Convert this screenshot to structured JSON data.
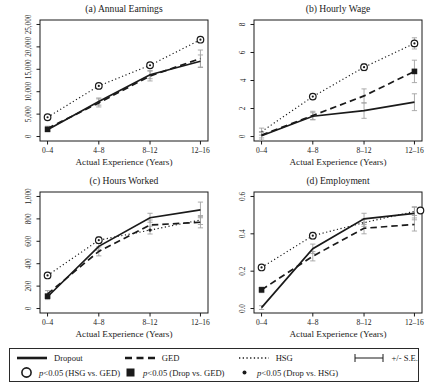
{
  "figure": {
    "xlabel": "Actual Experience (Years)",
    "categories": [
      "0–4",
      "4–8",
      "8–12",
      "12–16"
    ]
  },
  "chart_data": [
    {
      "type": "line",
      "title": "(a) Annual Earnings",
      "xlabel": "Actual Experience (Years)",
      "categories": [
        "0–4",
        "4–8",
        "8–12",
        "12–16"
      ],
      "ylim": [
        0,
        25000
      ],
      "yticks": [
        0,
        5000,
        10000,
        15000,
        20000,
        25000
      ],
      "ytick_labels": [
        "0",
        "5,000",
        "10,000",
        "15,000",
        "20,000",
        "25,000"
      ],
      "series": [
        {
          "name": "Dropout",
          "style": "solid",
          "values": [
            1500,
            7800,
            13800,
            16800
          ],
          "se": [
            400,
            800,
            900,
            1400
          ]
        },
        {
          "name": "GED",
          "style": "dashed",
          "values": [
            1800,
            7500,
            13500,
            17400
          ],
          "se": [
            500,
            900,
            1100,
            1900
          ]
        },
        {
          "name": "HSG",
          "style": "dotted",
          "values": [
            4300,
            11300,
            15900,
            21600
          ],
          "se": [
            300,
            400,
            500,
            600
          ]
        }
      ],
      "sig_markers": [
        {
          "type": "circle-dot",
          "x": 0,
          "y": 4300
        },
        {
          "type": "circle-dot",
          "x": 1,
          "y": 11300
        },
        {
          "type": "circle-dot",
          "x": 2,
          "y": 15900
        },
        {
          "type": "circle-dot",
          "x": 3,
          "y": 21600
        },
        {
          "type": "filled-square",
          "x": 0,
          "y": 1600
        }
      ]
    },
    {
      "type": "line",
      "title": "(b) Hourly Wage",
      "xlabel": "Actual Experience (Years)",
      "categories": [
        "0–4",
        "4–8",
        "8–12",
        "12–16"
      ],
      "ylim": [
        0,
        8
      ],
      "yticks": [
        0,
        2,
        4,
        6,
        8
      ],
      "ytick_labels": [
        "0",
        "2",
        "4",
        "6",
        "8"
      ],
      "series": [
        {
          "name": "Dropout",
          "style": "solid",
          "values": [
            0.05,
            1.45,
            1.85,
            2.45
          ],
          "se": [
            0.3,
            0.25,
            0.55,
            0.6
          ]
        },
        {
          "name": "GED",
          "style": "dashed",
          "values": [
            0.1,
            1.5,
            2.9,
            4.65
          ],
          "se": [
            0.2,
            0.3,
            0.5,
            0.8
          ]
        },
        {
          "name": "HSG",
          "style": "dotted",
          "values": [
            0.35,
            2.85,
            4.95,
            6.65
          ],
          "se": [
            0.25,
            0.2,
            0.25,
            0.4
          ]
        }
      ],
      "sig_markers": [
        {
          "type": "circle-dot",
          "x": 1,
          "y": 2.85
        },
        {
          "type": "circle-dot",
          "x": 2,
          "y": 4.95
        },
        {
          "type": "circle-dot",
          "x": 3,
          "y": 6.65
        },
        {
          "type": "filled-square",
          "x": 3,
          "y": 4.65
        }
      ]
    },
    {
      "type": "line",
      "title": "(c) Hours Worked",
      "xlabel": "Actual Experience (Years)",
      "categories": [
        "0–4",
        "4–8",
        "8–12",
        "12–16"
      ],
      "ylim": [
        0,
        1000
      ],
      "yticks": [
        0,
        200,
        400,
        600,
        800,
        1000
      ],
      "ytick_labels": [
        "0",
        "200",
        "400",
        "600",
        "800",
        "1,000"
      ],
      "series": [
        {
          "name": "Dropout",
          "style": "solid",
          "values": [
            105,
            555,
            810,
            880
          ],
          "se": [
            25,
            35,
            40,
            70
          ]
        },
        {
          "name": "GED",
          "style": "dashed",
          "values": [
            130,
            510,
            745,
            770
          ],
          "se": [
            30,
            40,
            45,
            50
          ]
        },
        {
          "name": "HSG",
          "style": "dotted",
          "values": [
            295,
            610,
            700,
            790
          ],
          "se": [
            20,
            30,
            35,
            40
          ]
        }
      ],
      "sig_markers": [
        {
          "type": "circle-dot",
          "x": 0,
          "y": 295
        },
        {
          "type": "circle-dot",
          "x": 1,
          "y": 610
        },
        {
          "type": "filled-dot",
          "x": 2,
          "y": 700
        },
        {
          "type": "filled-square",
          "x": 0,
          "y": 110
        }
      ]
    },
    {
      "type": "line",
      "title": "(d) Employment",
      "xlabel": "Actual Experience (Years)",
      "categories": [
        "0–4",
        "4–8",
        "8–12",
        "12–16"
      ],
      "ylim": [
        0,
        0.6
      ],
      "yticks": [
        0,
        0.2,
        0.4,
        0.6
      ],
      "ytick_labels": [
        "0.0",
        "0.2",
        "0.4",
        "0.6"
      ],
      "series": [
        {
          "name": "Dropout",
          "style": "solid",
          "values": [
            0.005,
            0.32,
            0.48,
            0.51
          ],
          "se": [
            0.01,
            0.025,
            0.03,
            0.035
          ]
        },
        {
          "name": "GED",
          "style": "dashed",
          "values": [
            0.1,
            0.28,
            0.43,
            0.45
          ],
          "se": [
            0.015,
            0.025,
            0.03,
            0.035
          ]
        },
        {
          "name": "HSG",
          "style": "dotted",
          "values": [
            0.22,
            0.39,
            0.46,
            0.52
          ],
          "se": [
            0.012,
            0.018,
            0.02,
            0.022
          ]
        }
      ],
      "sig_markers": [
        {
          "type": "circle-dot",
          "x": 0,
          "y": 0.22
        },
        {
          "type": "circle-dot",
          "x": 1,
          "y": 0.39
        },
        {
          "type": "open-circle",
          "x": 3,
          "y": 0.525,
          "dx": 6
        },
        {
          "type": "filled-square",
          "x": 0,
          "y": 0.1
        }
      ]
    }
  ],
  "legend": {
    "series": [
      {
        "name": "Dropout",
        "style": "solid"
      },
      {
        "name": "GED",
        "style": "dashed"
      },
      {
        "name": "HSG",
        "style": "dotted"
      }
    ],
    "se_label": "+/- S.E.",
    "sig": [
      {
        "marker": "open-circle",
        "p": "p",
        "rest": "<0.05 (HSG vs. GED)"
      },
      {
        "marker": "filled-square",
        "p": "p",
        "rest": "<0.05 (Drop vs. GED)"
      },
      {
        "marker": "filled-dot",
        "p": "p",
        "rest": "<0.05 (Drop vs. HSG)"
      }
    ],
    "colors": {
      "line": "#1a1a1a",
      "error_bar": "#a3a3a3"
    }
  }
}
